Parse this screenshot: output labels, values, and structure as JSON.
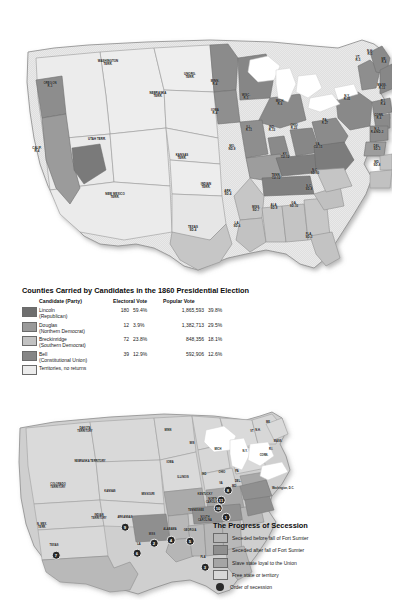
{
  "election_map": {
    "name": "Counties Carried by Candidates in the 1860 Presidential Election map",
    "state_labels": [
      {
        "id": "washington-terr",
        "text": "WASHINGTON\nTERR.",
        "x": 108,
        "y": 63
      },
      {
        "id": "oregon",
        "text": "OREGON\nR-3",
        "x": 50,
        "y": 85
      },
      {
        "id": "calif",
        "text": "CALIF.\nR-4",
        "x": 37,
        "y": 150
      },
      {
        "id": "utah-terr",
        "text": "UTAH TERR.",
        "x": 97,
        "y": 140
      },
      {
        "id": "new-mexico-terr",
        "text": "NEW MEXICO\nTERR.",
        "x": 115,
        "y": 196
      },
      {
        "id": "nebraska-terr",
        "text": "NEBRASKA\nTERR.",
        "x": 158,
        "y": 95
      },
      {
        "id": "unorg-terr",
        "text": "UNORG.\nTERR.",
        "x": 190,
        "y": 76
      },
      {
        "id": "kansas-terr",
        "text": "KANSAS\nTERR.",
        "x": 182,
        "y": 157
      },
      {
        "id": "indian-terr",
        "text": "INDIAN\nTERR.",
        "x": 206,
        "y": 186
      },
      {
        "id": "texas",
        "text": "TEXAS\nSD-4",
        "x": 193,
        "y": 229
      },
      {
        "id": "minn",
        "text": "MINN.\nR-4",
        "x": 215,
        "y": 83
      },
      {
        "id": "iowa",
        "text": "IOWA\nR-4",
        "x": 215,
        "y": 112
      },
      {
        "id": "wisc",
        "text": "WISC.\nR-5",
        "x": 246,
        "y": 97
      },
      {
        "id": "mich",
        "text": "MICH.\nR-6",
        "x": 280,
        "y": 103
      },
      {
        "id": "ill",
        "text": "ILL.\nR-11",
        "x": 249,
        "y": 129
      },
      {
        "id": "ind",
        "text": "IND.\nR-13",
        "x": 272,
        "y": 129
      },
      {
        "id": "ohio",
        "text": "OHIO\nR-23",
        "x": 294,
        "y": 127
      },
      {
        "id": "mo",
        "text": "MO.\nND-9",
        "x": 232,
        "y": 148
      },
      {
        "id": "ark",
        "text": "ARK.\nSD-4",
        "x": 228,
        "y": 193
      },
      {
        "id": "la",
        "text": "LA.\nSD-6",
        "x": 237,
        "y": 225
      },
      {
        "id": "miss",
        "text": "MISS.\nSD-7",
        "x": 256,
        "y": 209
      },
      {
        "id": "ala",
        "text": "ALA.\nSD-9",
        "x": 274,
        "y": 207
      },
      {
        "id": "ga",
        "text": "GA.\nSD-10",
        "x": 294,
        "y": 205
      },
      {
        "id": "fla",
        "text": "FLA.\nSD-3",
        "x": 309,
        "y": 236
      },
      {
        "id": "ky",
        "text": "KY.\nCU-12",
        "x": 285,
        "y": 156
      },
      {
        "id": "tenn",
        "text": "TENN.\nCU-12",
        "x": 276,
        "y": 177
      },
      {
        "id": "sc",
        "text": "S.C.\nSD-8",
        "x": 309,
        "y": 188
      },
      {
        "id": "nc",
        "text": "N.C.\nSD-10",
        "x": 315,
        "y": 172
      },
      {
        "id": "va",
        "text": "VA.\nCU-15",
        "x": 318,
        "y": 146
      },
      {
        "id": "pa",
        "text": "PA.\nR-27",
        "x": 325,
        "y": 122
      },
      {
        "id": "ny",
        "text": "N.Y.\nR-35",
        "x": 347,
        "y": 98
      },
      {
        "id": "vt",
        "text": "VT.\nR-5",
        "x": 358,
        "y": 59
      },
      {
        "id": "nh",
        "text": "N.H.\nR-5",
        "x": 370,
        "y": 53
      },
      {
        "id": "me",
        "text": "ME.\nR-8",
        "x": 384,
        "y": 61
      },
      {
        "id": "mass",
        "text": "MASS.\nR-13",
        "x": 382,
        "y": 87
      },
      {
        "id": "ri",
        "text": "R.I.\nR-4",
        "x": 383,
        "y": 103
      },
      {
        "id": "conn",
        "text": "CONN.\nR-6",
        "x": 379,
        "y": 117
      },
      {
        "id": "nj",
        "text": "N.J.\nR-4/ND-3",
        "x": 377,
        "y": 131
      },
      {
        "id": "del",
        "text": "DEL.\nSD-3",
        "x": 377,
        "y": 148
      },
      {
        "id": "md",
        "text": "MD.\nSD-8",
        "x": 377,
        "y": 164
      }
    ]
  },
  "election_legend": {
    "title": "Counties Carried by Candidates in the 1860 Presidential Election",
    "headers": {
      "candidate": "Candidate (Party)",
      "electoral": "Electoral Vote",
      "popular": "Popular Vote"
    },
    "rows": [
      {
        "swatch": "#6e6e6e",
        "candidate": "Lincoln",
        "party": "(Republican)",
        "electoral": "180",
        "electoral_pct": "59.4%",
        "popular": "1,865,593",
        "popular_pct": "39.8%"
      },
      {
        "swatch": "#9a9a9a",
        "candidate": "Douglas",
        "party": "(Northern Democrat)",
        "electoral": "12",
        "electoral_pct": "3.9%",
        "popular": "1,382,713",
        "popular_pct": "29.5%"
      },
      {
        "swatch": "#c2c2c2",
        "candidate": "Breckinridge",
        "party": "(Southern Democrat)",
        "electoral": "72",
        "electoral_pct": "23.8%",
        "popular": "848,356",
        "popular_pct": "18.1%"
      },
      {
        "swatch": "#868686",
        "candidate": "Bell",
        "party": "(Constitutional Union)",
        "electoral": "39",
        "electoral_pct": "12.9%",
        "popular": "592,906",
        "popular_pct": "12.6%"
      },
      {
        "swatch": "#ececec",
        "candidate": "Territories, no returns",
        "party": "",
        "electoral": "",
        "electoral_pct": "",
        "popular": "",
        "popular_pct": ""
      }
    ]
  },
  "secession_map": {
    "name": "The Progress of Secession map",
    "state_labels": [
      {
        "id": "dakota-territory",
        "text": "DAKOTA\nTERRITORY",
        "x": 85,
        "y": 431
      },
      {
        "id": "nebraska-territory",
        "text": "NEBRASKA TERRITORY",
        "x": 90,
        "y": 462
      },
      {
        "id": "colorado-territory",
        "text": "COLORADO\nTERRITORY",
        "x": 58,
        "y": 487
      },
      {
        "id": "kansas",
        "text": "KANSAS",
        "x": 110,
        "y": 492
      },
      {
        "id": "n-mex-terr",
        "text": "N. MEX.\nTERR.",
        "x": 42,
        "y": 527
      },
      {
        "id": "indian-territory",
        "text": "INDIAN\nTERRITORY",
        "x": 99,
        "y": 518
      },
      {
        "id": "texas",
        "text": "TEXAS",
        "x": 54,
        "y": 546
      },
      {
        "id": "minn",
        "text": "MINN",
        "x": 168,
        "y": 431
      },
      {
        "id": "iowa",
        "text": "IOWA",
        "x": 170,
        "y": 463
      },
      {
        "id": "wis",
        "text": "WIS",
        "x": 192,
        "y": 444
      },
      {
        "id": "mich",
        "text": "MICH",
        "x": 218,
        "y": 450
      },
      {
        "id": "illinois",
        "text": "ILLINOIS",
        "x": 183,
        "y": 478
      },
      {
        "id": "ind",
        "text": "IND",
        "x": 204,
        "y": 475
      },
      {
        "id": "ohio",
        "text": "OHIO",
        "x": 222,
        "y": 473
      },
      {
        "id": "missouri",
        "text": "MISSOURI",
        "x": 148,
        "y": 495
      },
      {
        "id": "arkansas",
        "text": "ARKANSAS",
        "x": 125,
        "y": 518
      },
      {
        "id": "la",
        "text": "LA",
        "x": 139,
        "y": 545
      },
      {
        "id": "miss",
        "text": "MISS",
        "x": 152,
        "y": 535
      },
      {
        "id": "alabama",
        "text": "ALABAMA",
        "x": 170,
        "y": 530
      },
      {
        "id": "georgia",
        "text": "GEORGIA",
        "x": 190,
        "y": 531
      },
      {
        "id": "fla",
        "text": "FLA",
        "x": 203,
        "y": 558
      },
      {
        "id": "kentucky",
        "text": "KENTUCKY",
        "x": 205,
        "y": 495
      },
      {
        "id": "tennessee",
        "text": "TENNESSEE",
        "x": 196,
        "y": 511
      },
      {
        "id": "north-carolina",
        "text": "NORTH\nCAROLINA",
        "x": 213,
        "y": 502
      },
      {
        "id": "south-carolina",
        "text": "SOUTH\nCAROLINA",
        "x": 205,
        "y": 520
      },
      {
        "id": "va",
        "text": "VA",
        "x": 221,
        "y": 484
      },
      {
        "id": "pa",
        "text": "PA",
        "x": 237,
        "y": 472
      },
      {
        "id": "ny",
        "text": "N.Y.",
        "x": 245,
        "y": 452
      },
      {
        "id": "vt",
        "text": "VT",
        "x": 252,
        "y": 432
      },
      {
        "id": "nh",
        "text": "N.H.",
        "x": 258,
        "y": 431
      },
      {
        "id": "me",
        "text": "ME",
        "x": 268,
        "y": 423
      },
      {
        "id": "mass",
        "text": "MASS.",
        "x": 278,
        "y": 442
      },
      {
        "id": "ri",
        "text": "R.I.",
        "x": 271,
        "y": 450
      },
      {
        "id": "conn",
        "text": "CONN.",
        "x": 264,
        "y": 456
      },
      {
        "id": "del",
        "text": "DEL.",
        "x": 238,
        "y": 482
      },
      {
        "id": "md",
        "text": "MD",
        "x": 234,
        "y": 487
      },
      {
        "id": "washington-dc",
        "text": "Washington, D.C.",
        "x": 283,
        "y": 489
      }
    ],
    "secession_order": [
      {
        "state": "south-carolina",
        "order": "1",
        "x": 226,
        "y": 517
      },
      {
        "state": "mississippi",
        "order": "2",
        "x": 154,
        "y": 543
      },
      {
        "state": "florida",
        "order": "3",
        "x": 205,
        "y": 567
      },
      {
        "state": "alabama",
        "order": "4",
        "x": 171,
        "y": 540
      },
      {
        "state": "georgia",
        "order": "5",
        "x": 190,
        "y": 541
      },
      {
        "state": "louisiana",
        "order": "6",
        "x": 137,
        "y": 553
      },
      {
        "state": "texas",
        "order": "7",
        "x": 56,
        "y": 555
      },
      {
        "state": "virginia",
        "order": "8",
        "x": 228,
        "y": 490
      },
      {
        "state": "arkansas",
        "order": "9",
        "x": 125,
        "y": 527
      },
      {
        "state": "tennessee",
        "order": "10",
        "x": 218,
        "y": 508
      },
      {
        "state": "north-carolina",
        "order": "11",
        "x": 221,
        "y": 500
      }
    ]
  },
  "secession_legend": {
    "title": "The Progress of Secession",
    "rows": [
      {
        "swatch": "#b6b6b6",
        "label": "Seceded before fall of Fort Sumter",
        "marker": false
      },
      {
        "swatch": "#8f8f8f",
        "label": "Seceded after fall of Fort Sumter",
        "marker": false
      },
      {
        "swatch": "#a5a5a5",
        "label": "Slave state loyal to the Union",
        "marker": false
      },
      {
        "swatch": "#d8d8d8",
        "label": "Free state or territory",
        "marker": false
      },
      {
        "swatch": "",
        "label": "Order of secession",
        "marker": true
      }
    ]
  }
}
